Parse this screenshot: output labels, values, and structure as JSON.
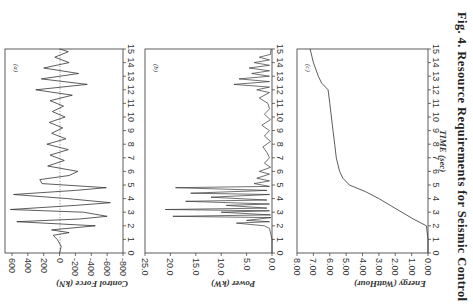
{
  "caption": "Fig. 4.   Resource Requirements for Seismic Control",
  "chart_data": [
    {
      "type": "line",
      "panel": "(a)",
      "title": "",
      "xlabel": "TIME (sec)",
      "ylabel": "Control Force (kN)",
      "xlim": [
        0,
        15
      ],
      "ylim": [
        -800,
        600
      ],
      "xticks": [
        0,
        1,
        2,
        3,
        4,
        5,
        6,
        7,
        8,
        9,
        10,
        11,
        12,
        13,
        14,
        15
      ],
      "yticks": [
        "600",
        "400",
        "200",
        "0",
        "-200",
        "-400",
        "-600",
        "-800"
      ],
      "zero_line": "dotted",
      "x": [
        0,
        0.5,
        1,
        1.3,
        1.5,
        1.7,
        2.0,
        2.3,
        2.5,
        2.7,
        3.0,
        3.2,
        3.5,
        3.7,
        4.0,
        4.3,
        4.6,
        4.8,
        5.1,
        5.4,
        5.7,
        6.0,
        6.4,
        6.8,
        7.2,
        7.6,
        8.0,
        8.4,
        8.8,
        9.2,
        9.6,
        10.0,
        10.4,
        10.8,
        11.2,
        11.6,
        12.0,
        12.4,
        12.8,
        13.2,
        13.6,
        14.0,
        14.4,
        14.8,
        15.0
      ],
      "values": [
        0,
        -20,
        30,
        80,
        -120,
        100,
        -450,
        540,
        -250,
        -600,
        -300,
        620,
        -200,
        -640,
        -100,
        580,
        -200,
        -590,
        220,
        250,
        -120,
        -230,
        150,
        -60,
        120,
        -110,
        160,
        -80,
        100,
        -40,
        130,
        -70,
        90,
        -50,
        120,
        -160,
        300,
        -350,
        230,
        -240,
        200,
        -120,
        60,
        -110,
        0
      ]
    },
    {
      "type": "line",
      "panel": "(b)",
      "title": "",
      "xlabel": "TIME (sec)",
      "ylabel": "Power (kW)",
      "xlim": [
        0,
        15
      ],
      "ylim": [
        0,
        25
      ],
      "xticks": [
        0,
        1,
        2,
        3,
        4,
        5,
        6,
        7,
        8,
        9,
        10,
        11,
        12,
        13,
        14,
        15
      ],
      "yticks": [
        "25.0",
        "20.0",
        "15.0",
        "10.0",
        "5.0",
        "0.0"
      ],
      "x": [
        0,
        1.0,
        1.8,
        2.0,
        2.2,
        2.3,
        2.4,
        2.6,
        2.7,
        2.8,
        3.0,
        3.1,
        3.2,
        3.3,
        3.5,
        3.6,
        3.8,
        3.9,
        4.1,
        4.3,
        4.4,
        4.6,
        4.8,
        4.9,
        5.1,
        5.3,
        5.5,
        5.8,
        6.0,
        6.3,
        6.6,
        7.0,
        7.4,
        7.8,
        8.2,
        8.6,
        9.0,
        9.4,
        9.8,
        10.2,
        10.6,
        11.0,
        11.4,
        11.8,
        12.0,
        12.2,
        12.4,
        12.6,
        12.8,
        13.0,
        13.2,
        13.4,
        13.6,
        13.8,
        14.0,
        14.2,
        14.4,
        14.6,
        15.0
      ],
      "values": [
        0,
        0,
        0.5,
        1.5,
        7.0,
        0.5,
        5.0,
        0.2,
        19.5,
        0.3,
        10.0,
        0.5,
        21.0,
        1.0,
        9.0,
        0.5,
        17.0,
        1.0,
        12.0,
        0.5,
        16.0,
        1.0,
        19.0,
        0.5,
        3.5,
        0.5,
        3.0,
        0.5,
        2.5,
        0.3,
        1.5,
        0.5,
        1.0,
        1.8,
        0.3,
        1.5,
        0.5,
        2.0,
        0.3,
        1.5,
        0.5,
        0.8,
        2.5,
        0.5,
        3.0,
        0.5,
        7.5,
        0.5,
        6.5,
        0.5,
        4.0,
        0.5,
        4.5,
        0.5,
        3.5,
        0.5,
        2.5,
        0.3,
        0.2
      ]
    },
    {
      "type": "line",
      "panel": "(c)",
      "title": "",
      "xlabel": "TIME (sec)",
      "ylabel": "Energy (WattHour)",
      "xlim": [
        0,
        15
      ],
      "ylim": [
        0,
        8
      ],
      "xticks": [
        0,
        1,
        2,
        3,
        4,
        5,
        6,
        7,
        8,
        9,
        10,
        11,
        12,
        13,
        14,
        15
      ],
      "yticks": [
        "8.00",
        "7.00",
        "6.00",
        "5.00",
        "4.00",
        "3.00",
        "2.00",
        "1.00",
        "0.00"
      ],
      "x": [
        0,
        1,
        2,
        2.5,
        3,
        3.5,
        4,
        4.5,
        5,
        5.5,
        6,
        7,
        8,
        9,
        10,
        11,
        12,
        12.5,
        13,
        14,
        15
      ],
      "values": [
        0,
        0,
        0.1,
        0.9,
        1.6,
        2.3,
        3.0,
        3.8,
        4.8,
        5.2,
        5.4,
        5.6,
        5.7,
        5.8,
        5.9,
        6.0,
        6.1,
        6.5,
        6.7,
        7.0,
        7.2
      ]
    }
  ],
  "panels": {
    "a": {
      "tag": "(a)",
      "ylabel": "Control Force (kN)"
    },
    "b": {
      "tag": "(b)",
      "ylabel": "Power (kW)"
    },
    "c": {
      "tag": "(c)",
      "ylabel": "Energy (WattHour)"
    }
  },
  "xlabel": "TIME (sec)"
}
